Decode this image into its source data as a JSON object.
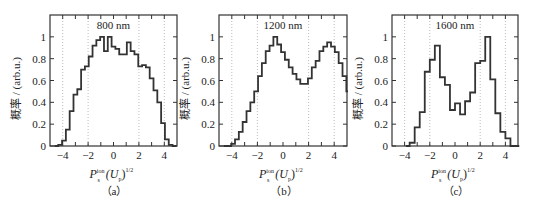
{
  "chart_data": [
    {
      "type": "bar",
      "subtype": "step-histogram",
      "panel_label": "(a)",
      "title": "800 nm",
      "xlabel": "P_s^ion (U_p)^1/2",
      "ylabel": "概率 / (arb.u.)",
      "xlim": [
        -5,
        5
      ],
      "ylim": [
        0,
        1.2
      ],
      "xticks": [
        -4,
        -2,
        0,
        2,
        4
      ],
      "yticks": [
        0,
        0.2,
        0.4,
        0.6,
        0.8,
        1
      ],
      "grid": "vertical dotted at -4,-2,2,4",
      "bin_width": 0.3,
      "x_start": -4.35,
      "values": [
        0.01,
        0.05,
        0.15,
        0.32,
        0.47,
        0.52,
        0.7,
        0.73,
        0.82,
        0.92,
        0.97,
        1.0,
        0.87,
        1.0,
        0.91,
        0.89,
        0.84,
        0.84,
        0.95,
        0.87,
        0.84,
        0.73,
        0.74,
        0.72,
        0.62,
        0.51,
        0.4,
        0.21,
        0.06,
        0.01
      ]
    },
    {
      "type": "bar",
      "subtype": "step-histogram",
      "panel_label": "(b)",
      "title": "1200 nm",
      "xlabel": "P_s^ion (U_p)^1/2",
      "ylabel": "概率 / (arb.u.)",
      "xlim": [
        -5,
        5
      ],
      "ylim": [
        0,
        1.2
      ],
      "xticks": [
        -4,
        -2,
        0,
        2,
        4
      ],
      "yticks": [
        0,
        0.2,
        0.4,
        0.6,
        0.8,
        1
      ],
      "grid": "vertical dotted at -4,-2,2,4",
      "bin_width": 0.3,
      "x_start": -4.35,
      "values": [
        0.0,
        0.02,
        0.06,
        0.13,
        0.22,
        0.32,
        0.4,
        0.5,
        0.64,
        0.76,
        0.87,
        0.92,
        1.0,
        0.93,
        0.86,
        0.79,
        0.72,
        0.66,
        0.61,
        0.57,
        0.57,
        0.62,
        0.72,
        0.78,
        0.87,
        0.91,
        0.95,
        0.91,
        0.86,
        0.76,
        0.64,
        0.5,
        0.4,
        0.31,
        0.22,
        0.12,
        0.04,
        0.01
      ]
    },
    {
      "type": "bar",
      "subtype": "step-histogram",
      "panel_label": "(c)",
      "title": "1600 nm",
      "xlabel": "P_s^ion (U_p)^1/2",
      "ylabel": "概率 / (arb.u.)",
      "xlim": [
        -5,
        5
      ],
      "ylim": [
        0,
        1.2
      ],
      "xticks": [
        -4,
        -2,
        0,
        2,
        4
      ],
      "yticks": [
        0,
        0.2,
        0.4,
        0.6,
        0.8,
        1
      ],
      "grid": "vertical dotted at -4,-2,2,4",
      "bin_width": 0.4,
      "x_start": -3.6,
      "values": [
        0.03,
        0.17,
        0.31,
        0.68,
        0.79,
        0.92,
        0.63,
        0.56,
        0.33,
        0.39,
        0.29,
        0.41,
        0.49,
        0.76,
        0.78,
        1.0,
        0.61,
        0.3,
        0.13,
        0.07,
        0.0
      ]
    }
  ],
  "panels": [
    {
      "title": "800 nm",
      "caption": "（a）"
    },
    {
      "title": "1200 nm",
      "caption": "（b）"
    },
    {
      "title": "1600 nm",
      "caption": "（c）"
    }
  ],
  "axis": {
    "ylabel": "概率 / (arb.u.)",
    "xlabel_main": "P",
    "xlabel_sup": "ion",
    "xlabel_sub": "s",
    "xlabel_rest": "(U",
    "xlabel_rest_sub": "p",
    "xlabel_rest_end": ")",
    "xlabel_exp": "1/2",
    "xtick_labels": [
      "−4",
      "−2",
      "0",
      "2",
      "4"
    ],
    "ytick_labels": [
      "0",
      "0.2",
      "0.4",
      "0.6",
      "0.8",
      "1"
    ]
  }
}
